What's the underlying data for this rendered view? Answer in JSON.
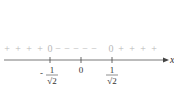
{
  "diagram": {
    "type": "sign-chart",
    "axis_label": "x",
    "points": [
      {
        "label_num": "1",
        "label_den": "√2",
        "sign": "-",
        "value": -0.7071
      },
      {
        "label": "0",
        "value": 0
      },
      {
        "label_num": "1",
        "label_den": "√2",
        "sign": "",
        "value": 0.7071
      }
    ],
    "sign_row": {
      "left": [
        "+",
        "+",
        "+",
        "+"
      ],
      "zero_left": "0",
      "middle": [
        "−",
        "−",
        "−",
        "−",
        "−"
      ],
      "zero_right": "0",
      "right": [
        "+",
        "+",
        "+",
        "+"
      ]
    }
  }
}
